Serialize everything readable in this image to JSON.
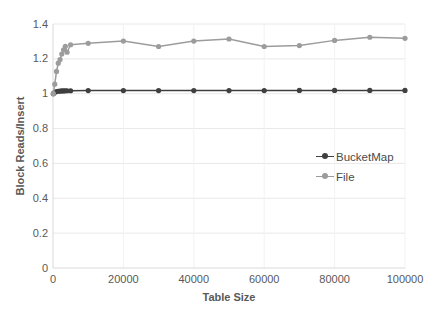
{
  "chart_data": {
    "type": "line",
    "title": "",
    "xlabel": "Table Size",
    "ylabel": "Block Reads/Insert",
    "xlim": [
      0,
      100000
    ],
    "ylim": [
      0,
      1.4
    ],
    "xticks": [
      0,
      20000,
      40000,
      60000,
      80000,
      100000
    ],
    "xticklabels": [
      "0",
      "20000",
      "40000",
      "60000",
      "80000",
      "100000"
    ],
    "yticks": [
      0,
      0.2,
      0.4,
      0.6,
      0.8,
      1.0,
      1.2,
      1.4
    ],
    "yticklabels": [
      "0",
      "0.2",
      "0.4",
      "0.6",
      "0.8",
      "1",
      "1.2",
      "1.4"
    ],
    "grid": true,
    "grid_axis": "y",
    "legend_position": "center-right",
    "series": [
      {
        "name": "BucketMap",
        "color": "#3f3f3f",
        "marker": "circle",
        "x": [
          100,
          500,
          1000,
          1500,
          2000,
          2500,
          3000,
          3500,
          4000,
          5000,
          10000,
          20000,
          30000,
          40000,
          50000,
          60000,
          70000,
          80000,
          90000,
          100000
        ],
        "y": [
          1.0,
          1.008,
          1.012,
          1.014,
          1.015,
          1.016,
          1.016,
          1.017,
          1.017,
          1.017,
          1.018,
          1.018,
          1.018,
          1.018,
          1.018,
          1.018,
          1.019,
          1.019,
          1.019,
          1.019
        ]
      },
      {
        "name": "File",
        "color": "#9c9c9c",
        "marker": "circle",
        "x": [
          100,
          500,
          1000,
          1500,
          2000,
          2500,
          3000,
          3500,
          4000,
          5000,
          10000,
          20000,
          30000,
          40000,
          50000,
          60000,
          70000,
          80000,
          90000,
          100000
        ],
        "y": [
          1.0,
          1.055,
          1.128,
          1.175,
          1.196,
          1.228,
          1.252,
          1.272,
          1.238,
          1.281,
          1.289,
          1.302,
          1.271,
          1.302,
          1.314,
          1.271,
          1.276,
          1.306,
          1.324,
          1.318
        ]
      }
    ]
  },
  "legend": {
    "entries": [
      {
        "label": "BucketMap",
        "color": "#3f3f3f"
      },
      {
        "label": "File",
        "color": "#9c9c9c"
      }
    ]
  },
  "axes": {
    "x_title": "Table Size",
    "y_title": "Block Reads/Insert"
  },
  "colors": {
    "bucketmap": "#3f3f3f",
    "file": "#9c9c9c",
    "gridline": "#e8e8e8",
    "axis": "#d9d9d9",
    "text": "#595959",
    "background": "#ffffff"
  }
}
